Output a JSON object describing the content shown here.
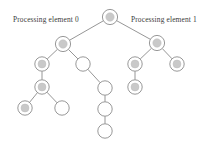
{
  "figure": {
    "width": 209,
    "height": 147,
    "background_color": "#ffffff"
  },
  "labels": [
    {
      "id": "pe0",
      "text": "Processing element 0",
      "x": 13,
      "y": 14.5
    },
    {
      "id": "pe1",
      "text": "Processing element 1",
      "x": 131,
      "y": 14.5
    }
  ],
  "style": {
    "edge_color": "#8a8a8a",
    "node_stroke_color": "#8c8c8c",
    "node_fill_hollow": "#ffffff",
    "node_fill_shaded": "#c9c9c9",
    "label_color": "#3b3b3b"
  },
  "chart_data": {
    "type": "diagram",
    "diagram_kind": "tree",
    "legend": [
      "Processing element 0",
      "Processing element 1"
    ],
    "node_styles": {
      "shaded": "gray-filled circle with outer ring",
      "hollow": "white circle with outline"
    },
    "nodes": [
      {
        "id": "n0",
        "label": "root",
        "x": 110,
        "y": 17,
        "r": 7.6,
        "style": "shaded",
        "group": "root"
      },
      {
        "id": "n1",
        "label": "pe0-root",
        "x": 63,
        "y": 44,
        "r": 7.6,
        "style": "shaded",
        "group": "pe0"
      },
      {
        "id": "n2",
        "label": "pe1-root",
        "x": 157,
        "y": 43,
        "r": 7.6,
        "style": "shaded",
        "group": "pe1"
      },
      {
        "id": "n3",
        "label": "pe0-a",
        "x": 42,
        "y": 64,
        "r": 7.2,
        "style": "shaded",
        "group": "pe0"
      },
      {
        "id": "n4",
        "label": "pe0-b",
        "x": 83,
        "y": 64,
        "r": 7.2,
        "style": "hollow",
        "group": "pe0"
      },
      {
        "id": "n5",
        "label": "pe0-c",
        "x": 42,
        "y": 87,
        "r": 7.2,
        "style": "shaded",
        "group": "pe0"
      },
      {
        "id": "n6",
        "label": "pe0-d",
        "x": 25,
        "y": 108,
        "r": 7.2,
        "style": "shaded",
        "group": "pe0"
      },
      {
        "id": "n7",
        "label": "pe0-e",
        "x": 62,
        "y": 108,
        "r": 7.2,
        "style": "hollow",
        "group": "pe0"
      },
      {
        "id": "n8",
        "label": "mid-a",
        "x": 105,
        "y": 88,
        "r": 7.2,
        "style": "hollow",
        "group": "pe0"
      },
      {
        "id": "n9",
        "label": "mid-b",
        "x": 105,
        "y": 109,
        "r": 7.2,
        "style": "hollow",
        "group": "pe0"
      },
      {
        "id": "n10",
        "label": "mid-c",
        "x": 105,
        "y": 131,
        "r": 7.2,
        "style": "hollow",
        "group": "pe0"
      },
      {
        "id": "n11",
        "label": "pe1-a",
        "x": 135,
        "y": 64,
        "r": 7.2,
        "style": "shaded",
        "group": "pe1"
      },
      {
        "id": "n12",
        "label": "pe1-b",
        "x": 177,
        "y": 64,
        "r": 7.2,
        "style": "shaded",
        "group": "pe1"
      },
      {
        "id": "n13",
        "label": "pe1-c",
        "x": 135,
        "y": 87,
        "r": 7.2,
        "style": "shaded",
        "group": "pe1"
      }
    ],
    "edges": [
      {
        "from": "n0",
        "to": "n1"
      },
      {
        "from": "n0",
        "to": "n2"
      },
      {
        "from": "n1",
        "to": "n3"
      },
      {
        "from": "n1",
        "to": "n4"
      },
      {
        "from": "n3",
        "to": "n5"
      },
      {
        "from": "n5",
        "to": "n6"
      },
      {
        "from": "n5",
        "to": "n7"
      },
      {
        "from": "n4",
        "to": "n8"
      },
      {
        "from": "n8",
        "to": "n9"
      },
      {
        "from": "n9",
        "to": "n10"
      },
      {
        "from": "n2",
        "to": "n11"
      },
      {
        "from": "n2",
        "to": "n12"
      },
      {
        "from": "n11",
        "to": "n13"
      }
    ]
  }
}
